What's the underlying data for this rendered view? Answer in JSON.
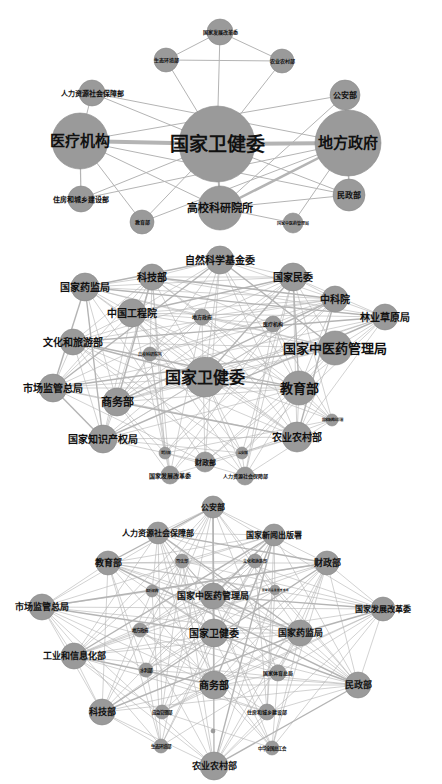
{
  "panels": [
    {
      "id": "network-1",
      "top": 0,
      "height": 240,
      "nodes": [
        {
          "id": "nhc",
          "label": "国家卫健委",
          "x": 217,
          "y": 144,
          "r": 38,
          "fs": 19
        },
        {
          "id": "med",
          "label": "医疗机构",
          "x": 80,
          "y": 141,
          "r": 28,
          "fs": 15
        },
        {
          "id": "loc",
          "label": "地方政府",
          "x": 348,
          "y": 143,
          "r": 33,
          "fs": 15
        },
        {
          "id": "uni",
          "label": "高校科研院所",
          "x": 220,
          "y": 208,
          "r": 22,
          "fs": 11
        },
        {
          "id": "hrss",
          "label": "人力资源社会保障部",
          "x": 92,
          "y": 93,
          "r": 13,
          "fs": 7
        },
        {
          "id": "ndrc",
          "label": "国家发展改革委",
          "x": 220,
          "y": 32,
          "r": 13,
          "fs": 5
        },
        {
          "id": "mee",
          "label": "生态环境部",
          "x": 166,
          "y": 60,
          "r": 12,
          "fs": 5
        },
        {
          "id": "moa",
          "label": "农业农村部",
          "x": 282,
          "y": 61,
          "r": 12,
          "fs": 5
        },
        {
          "id": "mps",
          "label": "公安部",
          "x": 345,
          "y": 95,
          "r": 15,
          "fs": 8
        },
        {
          "id": "mca",
          "label": "民政部",
          "x": 349,
          "y": 195,
          "r": 16,
          "fs": 8
        },
        {
          "id": "mohurd",
          "label": "住房和城乡建设部",
          "x": 81,
          "y": 199,
          "r": 13,
          "fs": 7
        },
        {
          "id": "moe",
          "label": "教育部",
          "x": 142,
          "y": 222,
          "r": 12,
          "fs": 5
        },
        {
          "id": "natcm",
          "label": "国家中医药管理局",
          "x": 293,
          "y": 223,
          "r": 10,
          "fs": 4
        }
      ],
      "edges": [
        [
          "med",
          "nhc",
          4
        ],
        [
          "nhc",
          "loc",
          4
        ],
        [
          "loc",
          "uni",
          2.5
        ],
        [
          "nhc",
          "uni",
          2
        ],
        [
          "ndrc",
          "mee",
          1
        ],
        [
          "ndrc",
          "moa",
          1
        ],
        [
          "mee",
          "moa",
          1
        ],
        [
          "ndrc",
          "nhc",
          1
        ],
        [
          "mee",
          "nhc",
          1
        ],
        [
          "moa",
          "nhc",
          1
        ],
        [
          "hrss",
          "med",
          1
        ],
        [
          "hrss",
          "nhc",
          1
        ],
        [
          "hrss",
          "loc",
          1
        ],
        [
          "mps",
          "med",
          1
        ],
        [
          "mps",
          "loc",
          1.5
        ],
        [
          "mps",
          "uni",
          1
        ],
        [
          "loc",
          "mca",
          1.5
        ],
        [
          "med",
          "mohurd",
          1.2
        ],
        [
          "med",
          "mca",
          1
        ],
        [
          "med",
          "uni",
          1
        ],
        [
          "med",
          "moe",
          1
        ],
        [
          "loc",
          "mohurd",
          1
        ],
        [
          "loc",
          "moe",
          1
        ],
        [
          "mca",
          "uni",
          1
        ],
        [
          "natcm",
          "uni",
          1
        ],
        [
          "natcm",
          "loc",
          1
        ],
        [
          "mohurd",
          "nhc",
          1
        ],
        [
          "mca",
          "nhc",
          1
        ],
        [
          "moe",
          "nhc",
          1
        ]
      ]
    },
    {
      "id": "network-2",
      "top": 235,
      "height": 255,
      "nodes": [
        {
          "id": "nhc",
          "label": "国家卫健委",
          "x": 205,
          "y": 142,
          "r": 20,
          "fs": 16
        },
        {
          "id": "nsfc",
          "label": "自然科学基金委",
          "x": 220,
          "y": 25,
          "r": 14,
          "fs": 10
        },
        {
          "id": "most",
          "label": "科技部",
          "x": 152,
          "y": 42,
          "r": 13,
          "fs": 10
        },
        {
          "id": "neac",
          "label": "国家民委",
          "x": 293,
          "y": 42,
          "r": 14,
          "fs": 10
        },
        {
          "id": "nmpa",
          "label": "国家药监局",
          "x": 85,
          "y": 52,
          "r": 14,
          "fs": 10
        },
        {
          "id": "cas",
          "label": "中科院",
          "x": 335,
          "y": 64,
          "r": 13,
          "fs": 10
        },
        {
          "id": "cae",
          "label": "中国工程院",
          "x": 132,
          "y": 78,
          "r": 14,
          "fs": 10
        },
        {
          "id": "forest",
          "label": "林业草原局",
          "x": 385,
          "y": 82,
          "r": 13,
          "fs": 10
        },
        {
          "id": "loc",
          "label": "地方政府",
          "x": 202,
          "y": 82,
          "r": 8,
          "fs": 5
        },
        {
          "id": "med",
          "label": "医疗机构",
          "x": 273,
          "y": 89,
          "r": 8,
          "fs": 5
        },
        {
          "id": "mct",
          "label": "文化和旅游部",
          "x": 73,
          "y": 107,
          "r": 13,
          "fs": 10
        },
        {
          "id": "natcm",
          "label": "国家中医药管理局",
          "x": 335,
          "y": 113,
          "r": 17,
          "fs": 13
        },
        {
          "id": "uni",
          "label": "高校科研院所",
          "x": 150,
          "y": 119,
          "r": 7,
          "fs": 4
        },
        {
          "id": "moe",
          "label": "教育部",
          "x": 299,
          "y": 153,
          "r": 17,
          "fs": 13
        },
        {
          "id": "samr",
          "label": "市场监管总局",
          "x": 53,
          "y": 153,
          "r": 14,
          "fs": 10
        },
        {
          "id": "mofcom",
          "label": "商务部",
          "x": 117,
          "y": 167,
          "r": 14,
          "fs": 11
        },
        {
          "id": "nrta",
          "label": "国家新闻出版署",
          "x": 332,
          "y": 185,
          "r": 6,
          "fs": 3.5
        },
        {
          "id": "cnipa",
          "label": "国家知识产权局",
          "x": 103,
          "y": 204,
          "r": 14,
          "fs": 10
        },
        {
          "id": "moa",
          "label": "农业农村部",
          "x": 297,
          "y": 202,
          "r": 15,
          "fs": 10
        },
        {
          "id": "moj",
          "label": "司法部",
          "x": 165,
          "y": 218,
          "r": 6,
          "fs": 3.5
        },
        {
          "id": "mps",
          "label": "公安部",
          "x": 242,
          "y": 218,
          "r": 6,
          "fs": 3.5
        },
        {
          "id": "mof",
          "label": "财政部",
          "x": 205,
          "y": 227,
          "r": 10,
          "fs": 7
        },
        {
          "id": "ndrc",
          "label": "国家发展改革委",
          "x": 170,
          "y": 240,
          "r": 9,
          "fs": 6
        },
        {
          "id": "hrss",
          "label": "人力资源社会保障部",
          "x": 245,
          "y": 241,
          "r": 9,
          "fs": 5
        }
      ],
      "edges": "dense"
    },
    {
      "id": "network-3",
      "top": 490,
      "height": 294,
      "nodes": [
        {
          "id": "mps",
          "label": "公安部",
          "x": 213,
          "y": 17,
          "r": 11,
          "fs": 8
        },
        {
          "id": "hrss",
          "label": "人力资源社会保障部",
          "x": 158,
          "y": 43,
          "r": 11,
          "fs": 8
        },
        {
          "id": "nrta",
          "label": "国家新闻出版署",
          "x": 274,
          "y": 45,
          "r": 11,
          "fs": 8
        },
        {
          "id": "moe",
          "label": "教育部",
          "x": 108,
          "y": 73,
          "r": 12,
          "fs": 9
        },
        {
          "id": "mof",
          "label": "财政部",
          "x": 327,
          "y": 73,
          "r": 12,
          "fs": 9
        },
        {
          "id": "moj",
          "label": "司法部",
          "x": 182,
          "y": 71,
          "r": 7,
          "fs": 4
        },
        {
          "id": "mct",
          "label": "文化和旅游部",
          "x": 255,
          "y": 71,
          "r": 7,
          "fs": 4
        },
        {
          "id": "med",
          "label": "医疗机构",
          "x": 152,
          "y": 101,
          "r": 6,
          "fs": 3.5
        },
        {
          "id": "natcm",
          "label": "国家中医药管理局",
          "x": 213,
          "y": 106,
          "r": 13,
          "fs": 9
        },
        {
          "id": "nmpa2",
          "label": "国家药品监督管理局",
          "x": 275,
          "y": 100,
          "r": 5,
          "fs": 2.5
        },
        {
          "id": "samr",
          "label": "市场监管总局",
          "x": 42,
          "y": 117,
          "r": 13,
          "fs": 9
        },
        {
          "id": "ndrc",
          "label": "国家发展改革委",
          "x": 383,
          "y": 119,
          "r": 12,
          "fs": 8
        },
        {
          "id": "loc",
          "label": "地方政府",
          "x": 140,
          "y": 140,
          "r": 7,
          "fs": 4.5
        },
        {
          "id": "nhc",
          "label": "国家卫健委",
          "x": 214,
          "y": 143,
          "r": 14,
          "fs": 10
        },
        {
          "id": "nmpa",
          "label": "国家药监局",
          "x": 300,
          "y": 143,
          "r": 13,
          "fs": 9
        },
        {
          "id": "miit",
          "label": "工业和信息化部",
          "x": 74,
          "y": 166,
          "r": 13,
          "fs": 9
        },
        {
          "id": "mwr",
          "label": "水利部",
          "x": 146,
          "y": 180,
          "r": 7,
          "fs": 4.5
        },
        {
          "id": "sport",
          "label": "国家体育总局",
          "x": 278,
          "y": 183,
          "r": 8,
          "fs": 5
        },
        {
          "id": "mofcom",
          "label": "商务部",
          "x": 214,
          "y": 195,
          "r": 14,
          "fs": 10
        },
        {
          "id": "mca",
          "label": "民政部",
          "x": 358,
          "y": 195,
          "r": 13,
          "fs": 9
        },
        {
          "id": "most",
          "label": "科技部",
          "x": 102,
          "y": 222,
          "r": 13,
          "fs": 9
        },
        {
          "id": "mem",
          "label": "应急管理部",
          "x": 162,
          "y": 222,
          "r": 7,
          "fs": 4.5
        },
        {
          "id": "mohurd",
          "label": "住房和城乡建设部",
          "x": 267,
          "y": 222,
          "r": 8,
          "fs": 5
        },
        {
          "id": "dot",
          "label": "",
          "x": 213,
          "y": 241,
          "r": 2,
          "fs": 0
        },
        {
          "id": "mee",
          "label": "生态环境部",
          "x": 161,
          "y": 256,
          "r": 7,
          "fs": 4.5
        },
        {
          "id": "acftu",
          "label": "中华全国总工会",
          "x": 272,
          "y": 258,
          "r": 7,
          "fs": 4.5
        },
        {
          "id": "moa",
          "label": "农业农村部",
          "x": 214,
          "y": 276,
          "r": 14,
          "fs": 9
        }
      ],
      "edges": "dense"
    }
  ],
  "colors": {
    "node_fill": "#9a9a9a",
    "edge": "#b4b4b4",
    "label": "#111111",
    "background": "#ffffff"
  }
}
